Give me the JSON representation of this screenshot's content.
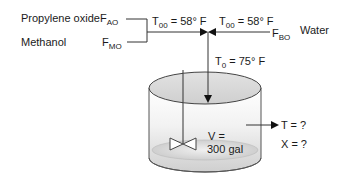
{
  "feeds": {
    "propylene_oxide": {
      "name": "Propylene oxide",
      "flow_symbol": "F",
      "flow_sub": "AO"
    },
    "methanol": {
      "name": "Methanol",
      "flow_symbol": "F",
      "flow_sub": "MO"
    },
    "water": {
      "name": "Water",
      "flow_symbol": "F",
      "flow_sub": "BO"
    }
  },
  "temperatures": {
    "left_stream": {
      "symbol": "T",
      "sub": "00",
      "value": " = 58° F"
    },
    "right_stream": {
      "symbol": "T",
      "sub": "00",
      "value": " = 58° F"
    },
    "combined_inlet": {
      "symbol": "T",
      "sub": "0",
      "value": " = 75° F"
    }
  },
  "tank": {
    "volume_label": "V =",
    "volume_value": "300 gal",
    "fill_color": "#d9d9d9",
    "stroke_color": "#333333"
  },
  "outlet": {
    "temperature": "T = ?",
    "conversion": "X = ?"
  }
}
